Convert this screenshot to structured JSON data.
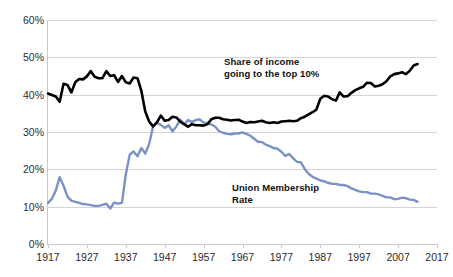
{
  "chart_data": {
    "type": "line",
    "title": "",
    "xlabel": "",
    "ylabel": "",
    "xlim": [
      1917,
      2017
    ],
    "ylim": [
      0,
      60
    ],
    "grid": true,
    "legend_position": "inline-annotations",
    "x_tick_labels": [
      "1917",
      "1927",
      "1937",
      "1947",
      "1957",
      "1967",
      "1977",
      "1987",
      "1997",
      "2007",
      "2017"
    ],
    "y_tick_labels": [
      "0%",
      "10%",
      "20%",
      "30%",
      "40%",
      "50%",
      "60%"
    ],
    "y_ticks": [
      0,
      10,
      20,
      30,
      40,
      50,
      60
    ],
    "annotations": [
      {
        "name": "income-share-label",
        "text": "Share of income\ngoing to the top 10%",
        "color": "#111111"
      },
      {
        "name": "union-rate-label",
        "text": "Union Membership\nRate",
        "color": "#111111"
      }
    ],
    "series": [
      {
        "name": "Share of income going to the top 10%",
        "color": "#000000",
        "x": [
          1917,
          1918,
          1919,
          1920,
          1921,
          1922,
          1923,
          1924,
          1925,
          1926,
          1927,
          1928,
          1929,
          1930,
          1931,
          1932,
          1933,
          1934,
          1935,
          1936,
          1937,
          1938,
          1939,
          1940,
          1941,
          1942,
          1943,
          1944,
          1945,
          1946,
          1947,
          1948,
          1949,
          1950,
          1951,
          1952,
          1953,
          1954,
          1955,
          1956,
          1957,
          1958,
          1959,
          1960,
          1961,
          1962,
          1963,
          1964,
          1965,
          1966,
          1967,
          1968,
          1969,
          1970,
          1971,
          1972,
          1973,
          1974,
          1975,
          1976,
          1977,
          1978,
          1979,
          1980,
          1981,
          1982,
          1983,
          1984,
          1985,
          1986,
          1987,
          1988,
          1989,
          1990,
          1991,
          1992,
          1993,
          1994,
          1995,
          1996,
          1997,
          1998,
          1999,
          2000,
          2001,
          2002,
          2003,
          2004,
          2005,
          2006,
          2007,
          2008,
          2009,
          2010,
          2011,
          2012
        ],
        "values": [
          40.3,
          39.9,
          39.5,
          38.1,
          42.9,
          42.6,
          40.6,
          43.3,
          44.2,
          44.1,
          44.9,
          46.3,
          44.8,
          44.4,
          44.4,
          46.3,
          45.0,
          45.2,
          43.4,
          45.0,
          43.3,
          43.0,
          44.6,
          44.4,
          41.0,
          35.5,
          32.8,
          31.5,
          32.6,
          34.4,
          33.0,
          33.2,
          34.1,
          33.9,
          32.8,
          32.1,
          31.4,
          32.1,
          31.8,
          31.8,
          31.7,
          32.1,
          33.4,
          33.8,
          33.8,
          33.4,
          33.3,
          33.1,
          33.2,
          33.3,
          32.8,
          32.4,
          32.7,
          32.6,
          32.8,
          33.0,
          32.6,
          32.4,
          32.6,
          32.4,
          32.8,
          32.9,
          33.0,
          32.9,
          33.0,
          33.7,
          34.1,
          34.7,
          35.3,
          36.0,
          38.9,
          39.7,
          39.5,
          38.8,
          38.4,
          40.6,
          39.5,
          39.6,
          40.5,
          41.2,
          41.7,
          42.1,
          43.2,
          43.1,
          42.2,
          42.4,
          42.8,
          43.6,
          44.9,
          45.5,
          45.7,
          46.0,
          45.5,
          46.4,
          47.8,
          48.2
        ]
      },
      {
        "name": "Union Membership Rate",
        "color": "#7b92c4",
        "x": [
          1917,
          1918,
          1919,
          1920,
          1921,
          1922,
          1923,
          1924,
          1925,
          1926,
          1927,
          1928,
          1929,
          1930,
          1931,
          1932,
          1933,
          1934,
          1935,
          1936,
          1937,
          1938,
          1939,
          1940,
          1941,
          1942,
          1943,
          1944,
          1945,
          1946,
          1947,
          1948,
          1949,
          1950,
          1951,
          1952,
          1953,
          1954,
          1955,
          1956,
          1957,
          1958,
          1959,
          1960,
          1961,
          1962,
          1963,
          1964,
          1965,
          1966,
          1967,
          1968,
          1969,
          1970,
          1971,
          1972,
          1973,
          1974,
          1975,
          1976,
          1977,
          1978,
          1979,
          1980,
          1981,
          1982,
          1983,
          1984,
          1985,
          1986,
          1987,
          1988,
          1989,
          1990,
          1991,
          1992,
          1993,
          1994,
          1995,
          1996,
          1997,
          1998,
          1999,
          2000,
          2001,
          2002,
          2003,
          2004,
          2005,
          2006,
          2007,
          2008,
          2009,
          2010,
          2011,
          2012
        ],
        "values": [
          11.0,
          12.1,
          14.3,
          17.9,
          15.6,
          12.7,
          11.6,
          11.3,
          11.0,
          10.7,
          10.6,
          10.4,
          10.2,
          10.2,
          10.5,
          10.8,
          9.5,
          11.1,
          10.8,
          11.0,
          18.6,
          23.9,
          24.8,
          23.5,
          25.7,
          24.2,
          26.8,
          31.4,
          32.5,
          31.9,
          31.1,
          31.8,
          30.2,
          31.5,
          33.3,
          32.0,
          33.2,
          32.7,
          33.2,
          33.4,
          32.5,
          32.4,
          32.0,
          31.4,
          30.2,
          29.8,
          29.5,
          29.4,
          29.6,
          29.6,
          29.9,
          29.5,
          29.0,
          28.2,
          27.4,
          27.3,
          26.6,
          26.2,
          25.7,
          25.5,
          24.7,
          23.6,
          24.1,
          23.0,
          22.0,
          21.9,
          20.1,
          18.8,
          18.0,
          17.5,
          17.0,
          16.8,
          16.4,
          16.1,
          16.1,
          15.8,
          15.8,
          15.5,
          14.9,
          14.5,
          14.1,
          13.9,
          13.9,
          13.5,
          13.5,
          13.3,
          12.9,
          12.5,
          12.5,
          12.0,
          12.1,
          12.4,
          12.3,
          11.9,
          11.8,
          11.3
        ]
      }
    ]
  }
}
